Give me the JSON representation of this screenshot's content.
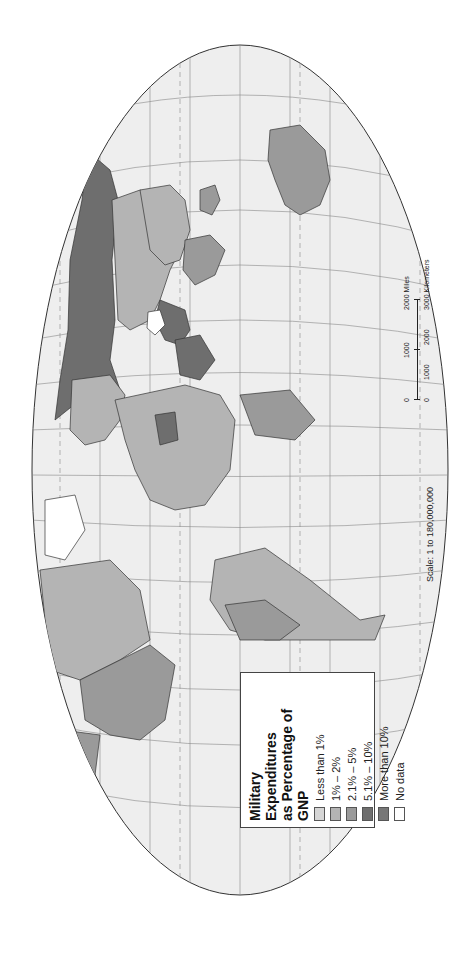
{
  "legend": {
    "title_line1": "Military Expenditures",
    "title_line2": "as Percentage of GNP",
    "items": [
      {
        "label": "Less than 1%",
        "color": "#d6d6d6"
      },
      {
        "label": "1% – 2%",
        "color": "#b4b4b4"
      },
      {
        "label": "2.1% – 5%",
        "color": "#9a9a9a"
      },
      {
        "label": "5.1% – 10%",
        "color": "#6e6e6e"
      },
      {
        "label": "More than 10%",
        "color": "#777777"
      },
      {
        "label": "No data",
        "color": "#ffffff"
      }
    ]
  },
  "scale": {
    "text": "Scale:  1 to 180,000,000",
    "miles_ticks": [
      "0",
      "1000",
      "2000 Miles"
    ],
    "km_ticks": [
      "0",
      "1000",
      "2000",
      "3000 Kilometers"
    ]
  },
  "colors": {
    "ocean": "#eeeeee",
    "graticule": "#888888",
    "border": "#333333"
  }
}
